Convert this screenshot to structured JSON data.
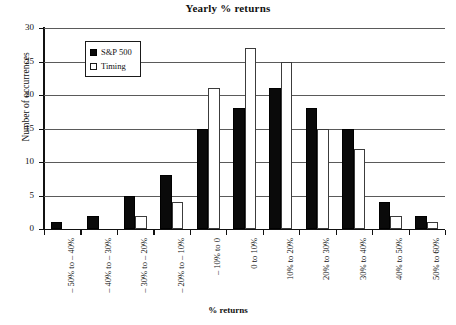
{
  "chart_data": {
    "type": "bar",
    "title": "Yearly % returns",
    "xlabel": "% returns",
    "ylabel": "Number of occurrences",
    "ylim": [
      0,
      30
    ],
    "ytick_step": 5,
    "yticks": [
      0,
      5,
      10,
      15,
      20,
      25,
      30
    ],
    "grid": true,
    "legend_position": "upper-left-inside",
    "categories": [
      "– 50% to – 40%",
      "– 40% to – 30%",
      "– 30% to – 20%",
      "– 20% to – 10%",
      "– 10% to 0",
      "0 to 10%",
      "10% to 20%",
      "20% to 30%",
      "30% to 40%",
      "40% to 50%",
      "50% to 60%"
    ],
    "series": [
      {
        "name": "S&P 500",
        "color": "#0a0a0a",
        "values": [
          1,
          2,
          5,
          8,
          15,
          18,
          21,
          18,
          15,
          4,
          2
        ]
      },
      {
        "name": "Timing",
        "color": "#ffffff",
        "values": [
          0,
          0,
          2,
          4,
          21,
          27,
          25,
          15,
          12,
          2,
          1
        ]
      }
    ]
  },
  "colors": {
    "series_sp500": "#0a0a0a",
    "series_timing": "#ffffff",
    "axis": "#111111",
    "gridline": "#5a5a5a",
    "background": "#ffffff"
  }
}
